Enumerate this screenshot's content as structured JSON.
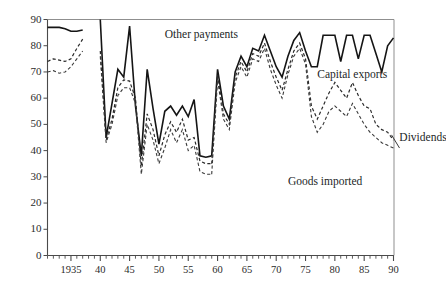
{
  "chart_data": {
    "type": "line",
    "title": "",
    "subtitle": "",
    "xlabel": "",
    "ylabel": "",
    "xlim": [
      1931,
      1990
    ],
    "ylim": [
      0,
      90
    ],
    "grid": false,
    "legend_position": "inline-annotations",
    "y_ticks": [
      0,
      10,
      20,
      30,
      40,
      50,
      60,
      70,
      80,
      90
    ],
    "y_tick_labels": [
      "0",
      "10",
      "20",
      "30",
      "40",
      "50",
      "60",
      "70",
      "80",
      "90"
    ],
    "x_ticks": [
      1935,
      1940,
      1945,
      1950,
      1955,
      1960,
      1965,
      1970,
      1975,
      1980,
      1985,
      1990
    ],
    "x_tick_labels": [
      "1935",
      "40",
      "45",
      "50",
      "55",
      "60",
      "65",
      "70",
      "75",
      "80",
      "85",
      "90"
    ],
    "x_minor_tick_interval": 1,
    "annotations": [
      {
        "text": "Other payments",
        "x": 1951,
        "y": 84
      },
      {
        "text": "Capital exports",
        "x": 1977,
        "y": 69
      },
      {
        "text": "Goods imported",
        "x": 1972,
        "y": 28
      },
      {
        "text": "Dividends",
        "x": 1991,
        "y": 45
      }
    ],
    "series": [
      {
        "name": "Other payments",
        "style": "solid",
        "color": "#151515",
        "width": 1.6,
        "segments": [
          {
            "x": [
              1931,
              1932,
              1933,
              1934,
              1935,
              1936,
              1937
            ],
            "values": [
              87,
              87,
              87,
              86.5,
              85.5,
              85.5,
              86
            ]
          },
          {
            "x": [
              1940,
              1941,
              1942,
              1943,
              1944,
              1945,
              1946,
              1947,
              1948,
              1949,
              1950,
              1951,
              1952,
              1953,
              1954,
              1955,
              1956,
              1957,
              1958,
              1959
            ],
            "values": [
              90,
              45,
              58,
              71,
              68,
              87.5,
              57,
              38,
              71,
              56,
              42.5,
              55,
              57,
              53.5,
              57,
              53,
              59.5,
              38,
              37.5,
              38
            ]
          },
          {
            "x": [
              1959,
              1960,
              1961,
              1962,
              1963,
              1964,
              1965,
              1966,
              1967,
              1968,
              1969,
              1970,
              1971,
              1972,
              1973,
              1974,
              1975,
              1976,
              1977,
              1978,
              1979,
              1980,
              1981,
              1982,
              1983,
              1984,
              1985,
              1986,
              1987,
              1988,
              1989,
              1990
            ],
            "values": [
              38,
              71,
              57,
              52,
              70,
              76,
              72,
              79,
              78,
              84,
              78,
              72,
              68,
              76,
              82,
              85,
              78,
              72,
              72,
              84,
              84,
              84,
              74,
              84,
              84,
              75,
              84,
              84,
              77,
              70,
              80,
              83
            ]
          }
        ]
      },
      {
        "name": "Capital exports",
        "style": "dashed",
        "color": "#2a2a2a",
        "width": 1.2,
        "segments": [
          {
            "x": [
              1931,
              1932,
              1933,
              1934,
              1935,
              1936,
              1937
            ],
            "values": [
              74,
              75,
              74.5,
              74,
              75,
              79,
              82.5
            ]
          },
          {
            "x": [
              1940,
              1941,
              1942,
              1943,
              1944,
              1945,
              1946,
              1947,
              1948,
              1949,
              1950,
              1951,
              1952,
              1953,
              1954,
              1955,
              1956,
              1957,
              1958,
              1959
            ],
            "values": [
              78,
              44,
              52,
              64,
              67,
              66.5,
              60,
              34,
              54,
              48,
              38,
              46,
              51,
              47,
              52,
              44,
              45,
              36,
              35,
              35
            ]
          },
          {
            "x": [
              1959,
              1960,
              1961,
              1962,
              1963,
              1964,
              1965,
              1966,
              1967,
              1968,
              1969,
              1970,
              1971,
              1972,
              1973,
              1974,
              1975,
              1976,
              1977,
              1978,
              1979,
              1980,
              1981,
              1982,
              1983,
              1984,
              1985,
              1986,
              1987,
              1988,
              1989,
              1990
            ],
            "values": [
              35,
              69,
              54,
              50,
              68,
              74,
              70,
              77,
              76,
              81,
              74,
              68,
              63,
              71,
              78,
              81,
              75,
              57,
              52,
              57,
              62,
              66,
              63,
              60,
              66,
              61,
              57,
              56,
              50,
              48,
              47,
              44
            ]
          }
        ]
      },
      {
        "name": "Dividends",
        "style": "dashed",
        "color": "#3a3a3a",
        "width": 1.1,
        "segments": [
          {
            "x": [
              1931,
              1932,
              1933,
              1934,
              1935,
              1936,
              1937
            ],
            "values": [
              70,
              70.5,
              69.5,
              70,
              72,
              75,
              78
            ]
          },
          {
            "x": [
              1940,
              1941,
              1942,
              1943,
              1944,
              1945,
              1946,
              1947,
              1948,
              1949,
              1950,
              1951,
              1952,
              1953,
              1954,
              1955,
              1956,
              1957,
              1958,
              1959
            ],
            "values": [
              76,
              43,
              50,
              61,
              64,
              64,
              58,
              31,
              50,
              44,
              35,
              41,
              48,
              43,
              48,
              40,
              42,
              32,
              31,
              31
            ]
          },
          {
            "x": [
              1959,
              1960,
              1961,
              1962,
              1963,
              1964,
              1965,
              1966,
              1967,
              1968,
              1969,
              1970,
              1971,
              1972,
              1973,
              1974,
              1975,
              1976,
              1977,
              1978,
              1979,
              1980,
              1981,
              1982,
              1983,
              1984,
              1985,
              1986,
              1987,
              1988,
              1989,
              1990
            ],
            "values": [
              31,
              67,
              52,
              48,
              66,
              72,
              68,
              75,
              74,
              79,
              71,
              65,
              60,
              69,
              76,
              79,
              73,
              53,
              47,
              50,
              55,
              57,
              55,
              53,
              58,
              54,
              50,
              47,
              45,
              43,
              42,
              41
            ]
          }
        ]
      }
    ]
  },
  "axes": {
    "y_axis_name": "value-axis",
    "x_axis_name": "year-axis"
  }
}
